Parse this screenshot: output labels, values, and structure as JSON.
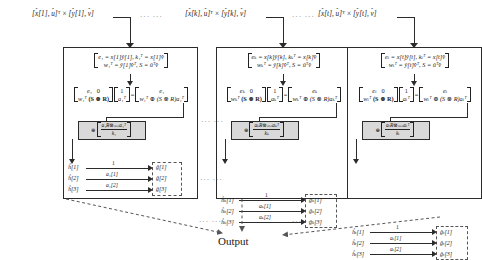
{
  "figure": {
    "output_label": "Output",
    "ellipsis": "···  ···"
  },
  "blocks": [
    {
      "id": "block-1",
      "index_symbol": "1",
      "header": {
        "lhs_vec": "[x[1], u]",
        "transpose": "T",
        "times": "×",
        "rhs_vec": "[ŷ[1], v̂]",
        "full": "[x[1], u]^T × [ŷ[1], v̂]"
      },
      "eq1": {
        "line1": "e₁ = x[1]ŷ[1],  k₁ᵀ = x[1]v̂",
        "line2": "w₁ᵀ = ŷ[1]v̂ᵀ,  S = ûᵀv̂"
      },
      "eq2": {
        "mat_r1c1": "e₁",
        "mat_r1c2": "0",
        "mat_r2c1": "w₁ᵀ",
        "mat_r2c2": "(S ⊗ R)",
        "vec_r1": "1",
        "vec_r2": "a₁ᵀ",
        "equals": "=",
        "res_r1": "e₁",
        "res_r2": "w₁ᵀ ⊕ (S ⊗ R)a₁ᵀ"
      },
      "eq3": {
        "oplus": "⊕",
        "num": "a₁R⊗ₘₙa₁ᵀ",
        "den": "k₁"
      },
      "graph": {
        "left_nodes": [
          "ĥ[1]",
          "ĥ[2]",
          "ĥ[3]"
        ],
        "right_nodes": [
          "ĝ[1]",
          "ĝ[2]",
          "ĝ[3]"
        ],
        "edge_labels": [
          "1",
          "a₁[1]",
          "a₁[2]"
        ]
      }
    },
    {
      "id": "block-k",
      "index_symbol": "k",
      "header": {
        "lhs_vec": "[x[k], u]",
        "transpose": "T",
        "times": "×",
        "rhs_vec": "[ŷ[k], v̂]",
        "full": "[x[k], u]^T × [ŷ[k], v̂]"
      },
      "eq1": {
        "line1": "eₖ = x[k]ŷ[k],  kₖᵀ = x[k]v̂",
        "line2": "wₖᵀ = ŷ[k]v̂ᵀ,  S = ûᵀv̂"
      },
      "eq2": {
        "mat_r1c1": "eₖ",
        "mat_r1c2": "0",
        "mat_r2c1": "wₖᵀ",
        "mat_r2c2": "(S ⊗ R)",
        "vec_r1": "1",
        "vec_r2": "aₖᵀ",
        "equals": "=",
        "res_r1": "eₖ",
        "res_r2": "wₖᵀ ⊕ (S ⊗ R)aₖᵀ"
      },
      "eq3": {
        "oplus": "⊕",
        "num": "aₖR⊗ₘₙaₖᵀ",
        "den": "kₖ"
      },
      "graph": {
        "left_nodes": [
          "ĥₖ[1]",
          "ĥₖ[2]",
          "ĥₖ[3]"
        ],
        "right_nodes": [
          "ĝₖ[1]",
          "ĝₖ[2]",
          "ĝₖ[3]"
        ],
        "edge_labels": [
          "1",
          "aₖ[1]",
          "aₖ[2]"
        ]
      }
    },
    {
      "id": "block-t",
      "index_symbol": "t",
      "header": {
        "lhs_vec": "[x[t], u]",
        "transpose": "T",
        "times": "×",
        "rhs_vec": "[ŷ[t], v̂]",
        "full": "[x[t], u]^T × [ŷ[t], v̂]"
      },
      "eq1": {
        "line1": "eₜ = x[t]ŷ[t],  kₜᵀ = x[t]v̂",
        "line2": "wₜᵀ = ŷ[t]v̂ᵀ,  S = ûᵀv̂"
      },
      "eq2": {
        "mat_r1c1": "eₜ",
        "mat_r1c2": "0",
        "mat_r2c1": "wₜᵀ",
        "mat_r2c2": "(S ⊗ R)",
        "vec_r1": "1",
        "vec_r2": "aₜᵀ",
        "equals": "=",
        "res_r1": "eₜ",
        "res_r2": "wₜᵀ ⊕ (S ⊗ R)aₜᵀ"
      },
      "eq3": {
        "oplus": "⊕",
        "num": "aₜR⊗ₘₙaₜᵀ",
        "den": "kₜ"
      },
      "graph": {
        "left_nodes": [
          "ĥₜ[1]",
          "ĥₜ[2]",
          "ĥₜ[3]"
        ],
        "right_nodes": [
          "ĝₜ[1]",
          "ĝₜ[2]",
          "ĝₜ[3]"
        ],
        "edge_labels": [
          "1",
          "aₜ[1]",
          "aₜ[2]"
        ]
      }
    }
  ]
}
